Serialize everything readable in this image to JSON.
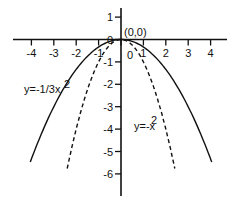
{
  "chart_data": {
    "type": "line",
    "title": "",
    "xlabel": "",
    "ylabel": "",
    "xlim": [
      -4.5,
      4.5
    ],
    "ylim": [
      -7,
      1.5
    ],
    "x_ticks": [
      -4,
      -3,
      -2,
      -1,
      0,
      1,
      2,
      3,
      4
    ],
    "y_ticks": [
      1,
      0,
      -1,
      -2,
      -3,
      -4,
      -5,
      -6
    ],
    "grid": false,
    "series": [
      {
        "name": "y=-1/3x²",
        "style": "solid",
        "function": "-x^2/3",
        "label": "y=-1/3x²"
      },
      {
        "name": "y=-x²",
        "style": "dashed",
        "function": "-x^2",
        "label": "y=-x²"
      }
    ],
    "annotations": [
      {
        "text": "(0,0)",
        "x": 0,
        "y": 0
      }
    ]
  },
  "labels": {
    "origin": "(0,0)",
    "solid_curve": "y=-1/3x",
    "dashed_curve": "y=-x",
    "sup": "2"
  }
}
